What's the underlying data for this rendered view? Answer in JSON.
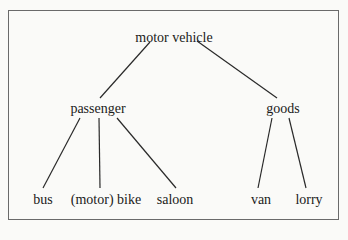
{
  "diagram": {
    "type": "tree",
    "root": {
      "label": "motor vehicle",
      "x": 174,
      "y": 30
    },
    "level1": [
      {
        "label": "passenger",
        "x": 98,
        "y": 101
      },
      {
        "label": "goods",
        "x": 283,
        "y": 101
      }
    ],
    "leaves": [
      {
        "label": "bus",
        "x": 43,
        "y": 192,
        "parent": "passenger"
      },
      {
        "label": "(motor) bike",
        "x": 106,
        "y": 192,
        "parent": "passenger"
      },
      {
        "label": "saloon",
        "x": 175,
        "y": 192,
        "parent": "passenger"
      },
      {
        "label": "van",
        "x": 261,
        "y": 192,
        "parent": "goods"
      },
      {
        "label": "lorry",
        "x": 309,
        "y": 192,
        "parent": "goods"
      }
    ],
    "edges": [
      {
        "from": "motor vehicle",
        "to": "passenger",
        "x1": 150,
        "y1": 42,
        "x2": 100,
        "y2": 98
      },
      {
        "from": "motor vehicle",
        "to": "goods",
        "x1": 197,
        "y1": 41,
        "x2": 277,
        "y2": 98
      },
      {
        "from": "passenger",
        "to": "bus",
        "x1": 80,
        "y1": 118,
        "x2": 43,
        "y2": 188
      },
      {
        "from": "passenger",
        "to": "(motor) bike",
        "x1": 99,
        "y1": 118,
        "x2": 100,
        "y2": 188
      },
      {
        "from": "passenger",
        "to": "saloon",
        "x1": 117,
        "y1": 118,
        "x2": 176,
        "y2": 188
      },
      {
        "from": "goods",
        "to": "van",
        "x1": 272,
        "y1": 118,
        "x2": 258,
        "y2": 188
      },
      {
        "from": "goods",
        "to": "lorry",
        "x1": 289,
        "y1": 118,
        "x2": 306,
        "y2": 188
      }
    ],
    "colors": {
      "line": "#2a2a2a",
      "border": "#6a6a6a",
      "background": "#fafaf8"
    }
  }
}
